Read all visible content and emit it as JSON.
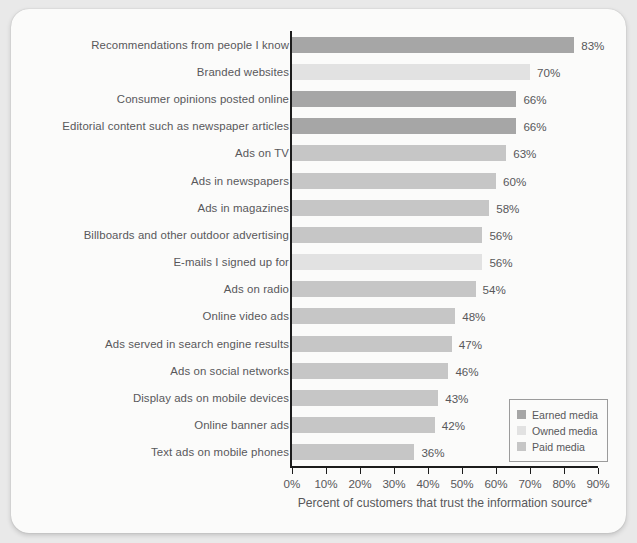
{
  "chart_data": {
    "type": "bar",
    "orientation": "horizontal",
    "title": "",
    "xlabel": "Percent of customers that trust the information source*",
    "ylabel": "",
    "xlim": [
      0,
      90
    ],
    "xticks": [
      "0%",
      "10%",
      "20%",
      "30%",
      "40%",
      "50%",
      "60%",
      "70%",
      "80%",
      "90%"
    ],
    "xtick_values": [
      0,
      10,
      20,
      30,
      40,
      50,
      60,
      70,
      80,
      90
    ],
    "grid": false,
    "legend_position": "bottom-right",
    "categories": [
      "Recommendations from people I know",
      "Branded websites",
      "Consumer opinions posted online",
      "Editorial content such as newspaper articles",
      "Ads on TV",
      "Ads in newspapers",
      "Ads in magazines",
      "Billboards and other outdoor advertising",
      "E-mails I signed up for",
      "Ads on radio",
      "Online video ads",
      "Ads served in search engine results",
      "Ads on social networks",
      "Display ads on mobile devices",
      "Online banner ads",
      "Text ads on mobile phones"
    ],
    "values": [
      83,
      70,
      66,
      66,
      63,
      60,
      58,
      56,
      56,
      54,
      48,
      47,
      46,
      43,
      42,
      36
    ],
    "value_labels": [
      "83%",
      "70%",
      "66%",
      "66%",
      "63%",
      "60%",
      "58%",
      "56%",
      "56%",
      "54%",
      "48%",
      "47%",
      "46%",
      "43%",
      "42%",
      "36%"
    ],
    "groups": [
      "earned",
      "owned",
      "earned",
      "earned",
      "paid",
      "paid",
      "paid",
      "paid",
      "owned",
      "paid",
      "paid",
      "paid",
      "paid",
      "paid",
      "paid",
      "paid"
    ],
    "series_colors": {
      "earned": "#a6a6a6",
      "owned": "#e2e2e2",
      "paid": "#c6c6c6"
    },
    "legend": [
      {
        "key": "earned",
        "label": "Earned media",
        "color": "#a6a6a6"
      },
      {
        "key": "owned",
        "label": "Owned media",
        "color": "#e2e2e2"
      },
      {
        "key": "paid",
        "label": "Paid media",
        "color": "#c6c6c6"
      }
    ]
  }
}
